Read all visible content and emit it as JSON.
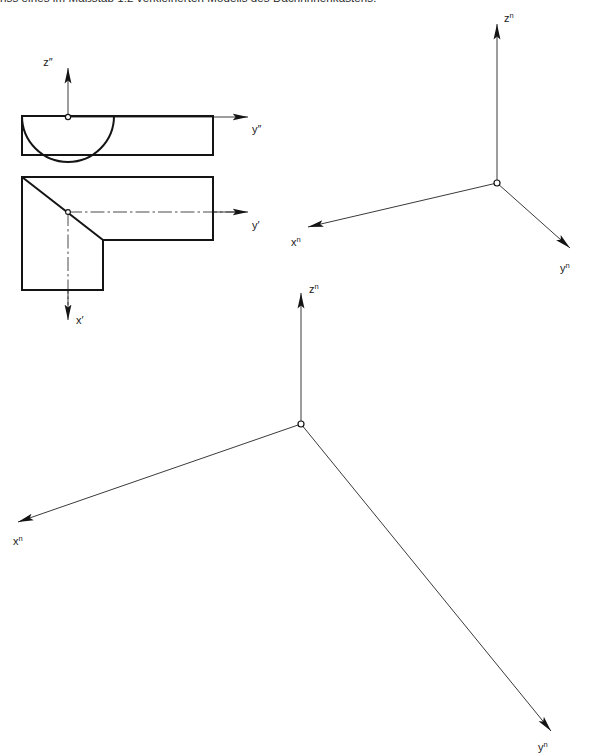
{
  "page": {
    "width": 604,
    "height": 755,
    "background": "#ffffff",
    "ink": "#1a1a1a"
  },
  "caption": {
    "text": "riss eines im Maßstab 1:2 verkleinerten Modells des Dachrinnenkastens.",
    "note": "clipped at top edge of image, only lower halves of glyphs visible"
  },
  "figure": {
    "kind": "technical-drawing"
  },
  "orthographic": {
    "elevation": {
      "label": "elevation-view",
      "origin_label_vertical": "z",
      "origin_label_vertical_prime": "″",
      "origin_label_horizontal": "y",
      "origin_label_horizontal_prime": "″",
      "box": {
        "x": 22,
        "y": 116,
        "w": 191,
        "h": 39
      },
      "arc": {
        "cx": 68,
        "cy": 116,
        "r": 46
      }
    },
    "plan": {
      "label": "plan-view",
      "origin_label_horizontal": "y",
      "origin_label_horizontal_prime": "′",
      "origin_label_vertical": "x",
      "origin_label_vertical_prime": "′",
      "outline": "L-shape with chamfer diagonal",
      "box": {
        "x": 22,
        "y": 177,
        "w": 191,
        "h": 113
      },
      "notch_x": 103,
      "notch_y": 240,
      "center": {
        "x": 68,
        "y": 212
      }
    }
  },
  "axes": {
    "upper": {
      "name": "upper-axis-triad",
      "origin": {
        "x": 497,
        "y": 183
      },
      "arms": [
        {
          "axis": "z",
          "sup": "n",
          "tip": {
            "x": 497,
            "y": 18
          },
          "label": {
            "x": 504,
            "y": 20
          }
        },
        {
          "axis": "x",
          "sup": "n",
          "tip": {
            "x": 303,
            "y": 228
          },
          "label": {
            "x": 292,
            "y": 246
          }
        },
        {
          "axis": "y",
          "sup": "n",
          "tip": {
            "x": 574,
            "y": 251
          },
          "label": {
            "x": 561,
            "y": 272
          }
        }
      ]
    },
    "lower": {
      "name": "lower-axis-triad",
      "origin": {
        "x": 301,
        "y": 424
      },
      "arms": [
        {
          "axis": "z",
          "sup": "n",
          "tip": {
            "x": 301,
            "y": 287
          },
          "label": {
            "x": 309,
            "y": 292
          }
        },
        {
          "axis": "x",
          "sup": "n",
          "tip": {
            "x": 12,
            "y": 524
          },
          "label": {
            "x": 14,
            "y": 545
          }
        },
        {
          "axis": "y",
          "sup": "n",
          "tip": {
            "x": 556,
            "y": 735
          },
          "label": {
            "x": 540,
            "y": 751
          }
        }
      ]
    }
  },
  "labels": {
    "z_double_prime": "z″",
    "y_double_prime": "y″",
    "y_prime": "y′",
    "x_prime": "x′",
    "z_n": "z",
    "x_n": "x",
    "y_n": "y",
    "superscript_n": "n"
  }
}
